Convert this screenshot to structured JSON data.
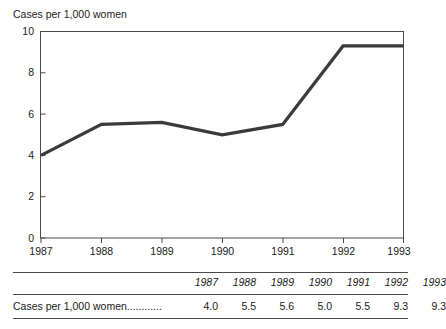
{
  "chart_data": {
    "type": "line",
    "title": "Cases per 1,000 women",
    "xlabel": "",
    "ylabel": "",
    "x": [
      "1987",
      "1988",
      "1989",
      "1990",
      "1991",
      "1992",
      "1993"
    ],
    "values": [
      4.0,
      5.5,
      5.6,
      5.0,
      5.5,
      9.3,
      9.3
    ],
    "series": [
      {
        "name": "Cases per 1,000 women",
        "values": [
          4.0,
          5.5,
          5.6,
          5.0,
          5.5,
          9.3,
          9.3
        ]
      }
    ],
    "ylim": [
      0,
      10
    ],
    "yticks": [
      0,
      2,
      4,
      6,
      8,
      10
    ],
    "ytick_labels": [
      "0",
      "2",
      "4",
      "6",
      "8",
      "10"
    ],
    "xtick_labels": [
      "1987",
      "1988",
      "1989",
      "1990",
      "1991",
      "1992",
      "1993"
    ],
    "grid": false,
    "legend": false,
    "line_color": "#3a3a3a",
    "axis_color": "#4a4a4a",
    "background": "#ffffff"
  },
  "chart": {
    "title": "Cases per 1,000 women",
    "y_labels": [
      "10",
      "8",
      "6",
      "4",
      "2",
      "0"
    ],
    "x_labels": [
      "1987",
      "1988",
      "1989",
      "1990",
      "1991",
      "1992",
      "1993"
    ]
  },
  "table": {
    "corner_header": "",
    "column_headers": [
      "1987",
      "1988",
      "1989",
      "1990",
      "1991",
      "1992",
      "1993"
    ],
    "rows": [
      {
        "label": "Cases per 1,000 women............",
        "values": [
          "4.0",
          "5.5",
          "5.6",
          "5.0",
          "5.5",
          "9.3",
          "9.3"
        ]
      }
    ]
  }
}
